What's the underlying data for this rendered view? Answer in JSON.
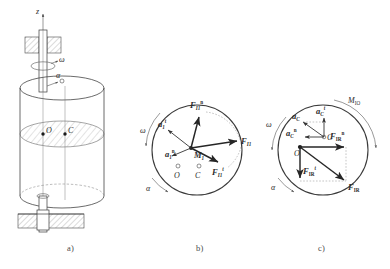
{
  "figure": {
    "captions": [
      {
        "id": "a",
        "text": "a)"
      },
      {
        "id": "b",
        "text": "b)"
      },
      {
        "id": "c",
        "text": "c)"
      }
    ]
  },
  "panel_a": {
    "name": "rotating-cylinder-assembly",
    "labels": {
      "axis_z": "z",
      "omega": "ω",
      "alpha": "α",
      "point_o": "O",
      "point_c": "C"
    },
    "description": "Vertical shaft in upper bearing and lower support carrying a cylindrical rotor; hatched mid-plane contains axis point O and mass centre C."
  },
  "panel_b": {
    "name": "acceleration-and-force-diagram",
    "labels": {
      "omega": "ω",
      "alpha": "α",
      "point_o": "O",
      "point_c": "C",
      "mass_point": {
        "base": "M",
        "sub": "1"
      },
      "a_tangential": {
        "base": "a",
        "sub": "1",
        "sup": "t"
      },
      "a_normal": {
        "base": "a",
        "sub": "1",
        "sup": "n"
      },
      "f_normal": {
        "base": "F",
        "sub": "I1",
        "sup": "n"
      },
      "f_tangential": {
        "base": "F",
        "sub": "I1",
        "sup": "t"
      },
      "f_resultant": {
        "base": "F",
        "sub": "I1",
        "sup": ""
      }
    }
  },
  "panel_c": {
    "name": "resultant-inertia-force-diagram",
    "labels": {
      "omega": "ω",
      "alpha": "α",
      "point_o": "O",
      "point_c": "C",
      "moment": {
        "base": "M",
        "sub": "IO"
      },
      "a_c": {
        "base": "a",
        "sub": "C",
        "sup": ""
      },
      "a_c_t": {
        "base": "a",
        "sub": "C",
        "sup": "t"
      },
      "a_c_n": {
        "base": "a",
        "sub": "C",
        "sup": "n"
      },
      "f_ir_n": {
        "base": "F",
        "sub": "IR",
        "sup": "n"
      },
      "f_ir_t": {
        "base": "F",
        "sub": "IR",
        "sup": "t"
      },
      "f_ir": {
        "base": "F",
        "sub": "IR",
        "sup": ""
      }
    }
  },
  "colors": {
    "ink": "#2b2b2b",
    "line": "#3a3a3a",
    "light": "#8a8a8a",
    "background": "#ffffff"
  }
}
